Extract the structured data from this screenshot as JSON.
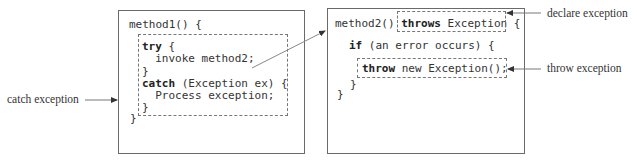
{
  "method1": {
    "header": "method1() {",
    "try_kw": "try",
    "try_rest": " {",
    "invoke": "  invoke method2;",
    "close1": "}",
    "catch_kw": "catch",
    "catch_rest": " (Exception ex) {",
    "process": "  Process exception;",
    "close2": "}",
    "close_method": "}"
  },
  "method2": {
    "header_pre": "method2() ",
    "throws_kw": "throws",
    "throws_rest": " Exception",
    "header_brace": " {",
    "if_line": "if (an error occurs) {",
    "throw_kw": "throw",
    "throw_rest": " new Exception();",
    "close_if": "}",
    "close_method": "}"
  },
  "labels": {
    "catch_exception": "catch exception",
    "declare_exception": "declare exception",
    "throw_exception": "throw exception"
  }
}
